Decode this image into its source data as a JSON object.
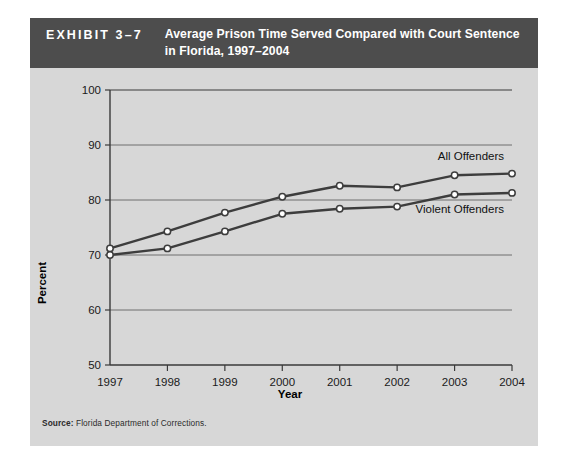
{
  "exhibit": {
    "kicker": "EXHIBIT 3–7",
    "title_line1": "Average Prison Time Served Compared with Court Sentence",
    "title_line2": "in Florida, 1997–2004",
    "header_bg": "#4d4d4d",
    "panel_bg": "#d7d7d7"
  },
  "source": {
    "label": "Source:",
    "text": " Florida Department of Corrections."
  },
  "chart_data": {
    "type": "line",
    "title": "Average Prison Time Served Compared with Court Sentence in Florida, 1997–2004",
    "xlabel": "Year",
    "ylabel": "Percent",
    "categories": [
      "1997",
      "1998",
      "1999",
      "2000",
      "2001",
      "2002",
      "2003",
      "2004"
    ],
    "x": [
      1997,
      1998,
      1999,
      2000,
      2001,
      2002,
      2003,
      2004
    ],
    "xlim": [
      1997,
      2004
    ],
    "ylim": [
      50,
      100
    ],
    "yticks": [
      50,
      60,
      70,
      80,
      90,
      100
    ],
    "ytick_labels": [
      "50",
      "60",
      "70",
      "80",
      "90",
      "100"
    ],
    "grid": "horizontal",
    "legend_position": "inline-right",
    "series": [
      {
        "name": "All Offenders",
        "label": "All Offenders",
        "color": "#3d3d3d",
        "marker": "open-circle",
        "values": [
          71.2,
          74.3,
          77.7,
          80.6,
          82.6,
          82.3,
          84.5,
          84.8
        ]
      },
      {
        "name": "Violent Offenders",
        "label": "Violent Offenders",
        "color": "#3d3d3d",
        "marker": "open-circle",
        "values": [
          70.0,
          71.2,
          74.3,
          77.5,
          78.4,
          78.8,
          81.0,
          81.3
        ]
      }
    ]
  }
}
